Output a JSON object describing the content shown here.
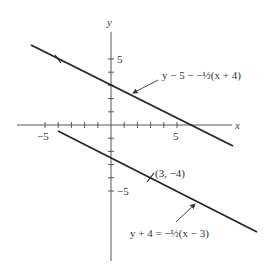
{
  "axes": {
    "x_label": "x",
    "y_label": "y",
    "x_tick_labels": {
      "neg": "−5",
      "pos": "5"
    },
    "y_tick_labels": {
      "pos": "5",
      "neg": "−5"
    },
    "x_range": [
      -6,
      9
    ],
    "y_range": [
      -10,
      7
    ],
    "tick_spacing": 1
  },
  "lines": [
    {
      "name": "line-1",
      "equation_label": "y − 5 − −½(x + 4)",
      "equation": "y - 5 = -1/2(x + 4)",
      "slope": -0.5,
      "marked_point": {
        "x": -4,
        "y": 5,
        "label": ""
      }
    },
    {
      "name": "line-2",
      "equation_label": "y + 4 = −½(x − 3)",
      "equation": "y + 4 = -1/2(x - 3)",
      "slope": -0.5,
      "marked_point": {
        "x": 3,
        "y": -4,
        "label": "(3, −4)"
      }
    }
  ],
  "colors": {
    "line": "#222222",
    "axis": "#555555",
    "text": "#333333"
  }
}
